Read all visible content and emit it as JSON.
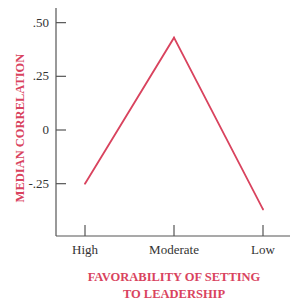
{
  "chart_data": {
    "type": "line",
    "title": "",
    "xlabel_lines": [
      "FAVORABILITY OF SETTING",
      "TO LEADERSHIP"
    ],
    "ylabel": "MEDIAN CORRELATION",
    "categories": [
      "High",
      "Moderate",
      "Low"
    ],
    "y_ticks": [
      0.5,
      0.25,
      0,
      -0.25
    ],
    "y_tick_labels": [
      ".50",
      ".25",
      "0",
      "-.25"
    ],
    "ylim": [
      -0.5,
      0.5
    ],
    "grid": false,
    "legend": "none",
    "series": [
      {
        "name": "Median correlation",
        "values": [
          -0.25,
          0.43,
          -0.37
        ]
      }
    ],
    "colors": {
      "series": "#d9435e",
      "axis_title": "#d9435e",
      "axis": "#555555",
      "tick_text": "#333333"
    }
  }
}
